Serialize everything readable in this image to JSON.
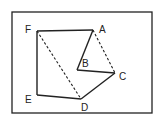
{
  "diagram": {
    "type": "geometry-figure",
    "frame": {
      "x": 12,
      "y": 12,
      "width": 140,
      "height": 101
    },
    "points": [
      {
        "id": "A",
        "label": "A",
        "x": 93,
        "y": 30,
        "lx": 99,
        "ly": 33
      },
      {
        "id": "B",
        "label": "B",
        "x": 77,
        "y": 70,
        "lx": 82,
        "ly": 67
      },
      {
        "id": "C",
        "label": "C",
        "x": 115,
        "y": 73,
        "lx": 119,
        "ly": 80
      },
      {
        "id": "D",
        "label": "D",
        "x": 81,
        "y": 99,
        "lx": 81,
        "ly": 111
      },
      {
        "id": "E",
        "label": "E",
        "x": 37,
        "y": 95,
        "lx": 25,
        "ly": 103
      },
      {
        "id": "F",
        "label": "F",
        "x": 37,
        "y": 31,
        "lx": 25,
        "ly": 33
      }
    ],
    "solid_edges": [
      [
        "F",
        "A"
      ],
      [
        "A",
        "B"
      ],
      [
        "B",
        "C"
      ],
      [
        "C",
        "D"
      ],
      [
        "D",
        "E"
      ],
      [
        "E",
        "F"
      ]
    ],
    "dashed_edges": [
      [
        "F",
        "D"
      ],
      [
        "A",
        "C"
      ]
    ],
    "colors": {
      "line": "#222222",
      "background": "#ffffff"
    }
  }
}
